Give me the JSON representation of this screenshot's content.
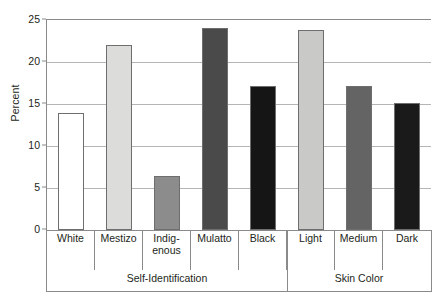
{
  "chart_data": {
    "type": "bar",
    "title": "",
    "xlabel": "",
    "ylabel": "Percent",
    "ylim": [
      0,
      25
    ],
    "yticks": [
      0,
      5,
      10,
      15,
      20,
      25
    ],
    "ytick_labels": [
      "0",
      "5",
      "10",
      "15",
      "20",
      "25"
    ],
    "grid": true,
    "legend": "none",
    "categories": [
      "White",
      "Mestizo",
      "Indig-\nenous",
      "Mulatto",
      "Black",
      "Light",
      "Medium",
      "Dark"
    ],
    "category_labels_flat": [
      "White",
      "Mestizo",
      "Indigenous",
      "Mulatto",
      "Black",
      "Light",
      "Medium",
      "Dark"
    ],
    "values": [
      13.9,
      22.0,
      6.4,
      24.0,
      17.2,
      23.8,
      17.2,
      15.1
    ],
    "bar_colors": [
      "#ffffff",
      "#dcdcda",
      "#8c8c8c",
      "#4a4a4a",
      "#151515",
      "#c9c9c7",
      "#646464",
      "#1a1a1a"
    ],
    "groups": [
      {
        "label": "Self-Identification",
        "categories": [
          "White",
          "Mestizo",
          "Indig-\nenous",
          "Mulatto",
          "Black"
        ]
      },
      {
        "label": "Skin Color",
        "categories": [
          "Light",
          "Medium",
          "Dark"
        ]
      }
    ]
  },
  "style": {
    "axis_color": "#8a8a8a",
    "grid_color": "#b5b5b5",
    "text_color": "#231f20",
    "bar_edge_color": "#6e6e6e",
    "background": "#ffffff"
  }
}
